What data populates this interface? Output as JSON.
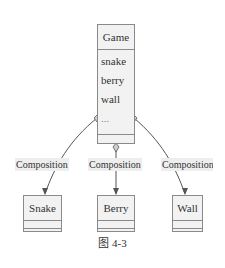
{
  "diagram": {
    "type": "uml-class-diagram",
    "container_class": {
      "name": "Game",
      "attributes": [
        "snake",
        "berry",
        "wall",
        "..."
      ]
    },
    "relations": [
      {
        "from": "Game",
        "to": "Snake",
        "label": "Composition"
      },
      {
        "from": "Game",
        "to": "Berry",
        "label": "Composition"
      },
      {
        "from": "Game",
        "to": "Wall",
        "label": "Composition"
      }
    ],
    "classes": [
      {
        "name": "Snake"
      },
      {
        "name": "Berry"
      },
      {
        "name": "Wall"
      }
    ],
    "caption": "图 4-3"
  }
}
